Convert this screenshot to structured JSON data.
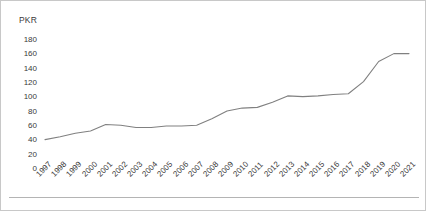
{
  "chart_data": {
    "type": "line",
    "title": "",
    "subtitle": "",
    "xlabel": "",
    "ylabel": "PKR",
    "unit_label": "PKR",
    "ylim": [
      0,
      180
    ],
    "y_ticks": [
      180,
      160,
      140,
      120,
      100,
      80,
      60,
      40,
      20,
      0
    ],
    "grid": false,
    "legend": false,
    "legend_position": "none",
    "line_color": "#808080",
    "background_color": "#ffffff",
    "border_color": "#c8c8c8",
    "axis_text_color": "#3a3a3a",
    "categories": [
      "1997",
      "1998",
      "1999",
      "2000",
      "2001",
      "2002",
      "2003",
      "2004",
      "2005",
      "2006",
      "2007",
      "2008",
      "2009",
      "2010",
      "2011",
      "2012",
      "2013",
      "2014",
      "2015",
      "2016",
      "2017",
      "2018",
      "2019",
      "2020",
      "2021"
    ],
    "series": [
      {
        "name": "PKR",
        "values": [
          41,
          45,
          50,
          53,
          62,
          61,
          58,
          58,
          60,
          60,
          61,
          70,
          81,
          85,
          86,
          93,
          102,
          101,
          102,
          104,
          105,
          122,
          150,
          161,
          161
        ]
      }
    ]
  }
}
